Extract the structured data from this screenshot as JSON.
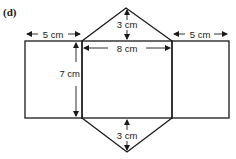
{
  "figure": {
    "part_label": "(d)",
    "colors": {
      "stroke": "#1a1a1a",
      "background": "#ffffff"
    }
  },
  "dimensions": {
    "left_rect_width": "5 cm",
    "right_rect_width": "5 cm",
    "middle_rect_width": "8 cm",
    "rect_height": "7 cm",
    "top_triangle_height": "3 cm",
    "bottom_triangle_height": "3 cm"
  }
}
